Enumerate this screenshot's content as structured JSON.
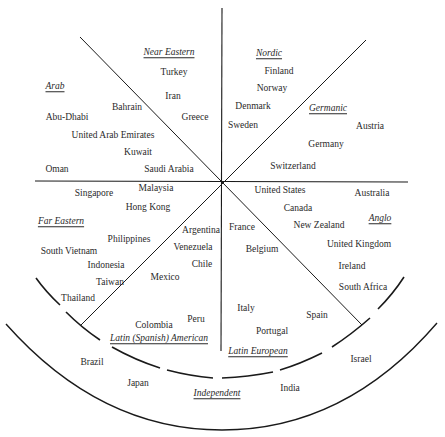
{
  "diagram": {
    "type": "country-cluster-circle",
    "center": {
      "x": 222,
      "y": 182
    },
    "clusters": [
      {
        "name": "Arab",
        "label_pos": [
          55,
          87
        ],
        "countries": [
          {
            "name": "Bahrain",
            "pos": [
              127,
              108
            ]
          },
          {
            "name": "Abu-Dhabi",
            "pos": [
              67,
              118
            ]
          },
          {
            "name": "United Arab Emirates",
            "pos": [
              113,
              136
            ]
          },
          {
            "name": "Kuwait",
            "pos": [
              138,
              153
            ]
          },
          {
            "name": "Oman",
            "pos": [
              57,
              170
            ]
          },
          {
            "name": "Saudi Arabia",
            "pos": [
              169,
              170
            ]
          }
        ]
      },
      {
        "name": "Near Eastern",
        "label_pos": [
          169,
          53
        ],
        "countries": [
          {
            "name": "Turkey",
            "pos": [
              174,
              73
            ]
          },
          {
            "name": "Iran",
            "pos": [
              173,
              97
            ]
          },
          {
            "name": "Greece",
            "pos": [
              195,
              118
            ]
          }
        ]
      },
      {
        "name": "Nordic",
        "label_pos": [
          269,
          54
        ],
        "countries": [
          {
            "name": "Finland",
            "pos": [
              279,
              72
            ]
          },
          {
            "name": "Norway",
            "pos": [
              272,
              89
            ]
          },
          {
            "name": "Denmark",
            "pos": [
              253,
              107
            ]
          },
          {
            "name": "Sweden",
            "pos": [
              243,
              126
            ]
          }
        ]
      },
      {
        "name": "Germanic",
        "label_pos": [
          328,
          109
        ],
        "countries": [
          {
            "name": "Austria",
            "pos": [
              370,
              127
            ]
          },
          {
            "name": "Germany",
            "pos": [
              326,
              145
            ]
          },
          {
            "name": "Switzerland",
            "pos": [
              293,
              167
            ]
          }
        ]
      },
      {
        "name": "Anglo",
        "label_pos": [
          380,
          219
        ],
        "countries": [
          {
            "name": "United States",
            "pos": [
              280,
              191
            ]
          },
          {
            "name": "Australia",
            "pos": [
              372,
              194
            ]
          },
          {
            "name": "Canada",
            "pos": [
              298,
              209
            ]
          },
          {
            "name": "New Zealand",
            "pos": [
              319,
              226
            ]
          },
          {
            "name": "United Kingdom",
            "pos": [
              359,
              245
            ]
          },
          {
            "name": "Ireland",
            "pos": [
              352,
              267
            ]
          },
          {
            "name": "South Africa",
            "pos": [
              363,
              288
            ]
          }
        ]
      },
      {
        "name": "Latin European",
        "label_pos": [
          258,
          352
        ],
        "countries": [
          {
            "name": "France",
            "pos": [
              242,
              228
            ]
          },
          {
            "name": "Belgium",
            "pos": [
              262,
              250
            ]
          },
          {
            "name": "Italy",
            "pos": [
              246,
              309
            ]
          },
          {
            "name": "Spain",
            "pos": [
              317,
              316
            ]
          },
          {
            "name": "Portugal",
            "pos": [
              272,
              332
            ]
          }
        ]
      },
      {
        "name": "Latin (Spanish) American",
        "label_pos": [
          159,
          339
        ],
        "countries": [
          {
            "name": "Argentina",
            "pos": [
              201,
              231
            ]
          },
          {
            "name": "Venezuela",
            "pos": [
              193,
              248
            ]
          },
          {
            "name": "Chile",
            "pos": [
              202,
              265
            ]
          },
          {
            "name": "Mexico",
            "pos": [
              165,
              278
            ]
          },
          {
            "name": "Peru",
            "pos": [
              196,
              320
            ]
          },
          {
            "name": "Colombia",
            "pos": [
              154,
              326
            ]
          }
        ]
      },
      {
        "name": "Far Eastern",
        "label_pos": [
          61,
          222
        ],
        "countries": [
          {
            "name": "Malaysia",
            "pos": [
              156,
              189
            ]
          },
          {
            "name": "Singapore",
            "pos": [
              94,
              194
            ]
          },
          {
            "name": "Hong Kong",
            "pos": [
              148,
              208
            ]
          },
          {
            "name": "Philippines",
            "pos": [
              129,
              240
            ]
          },
          {
            "name": "South Vietnam",
            "pos": [
              69,
              252
            ]
          },
          {
            "name": "Indonesia",
            "pos": [
              106,
              266
            ]
          },
          {
            "name": "Taiwan",
            "pos": [
              110,
              283
            ]
          },
          {
            "name": "Thailand",
            "pos": [
              78,
              299
            ]
          }
        ]
      },
      {
        "name": "Independent",
        "label_pos": [
          217,
          394
        ],
        "countries": [
          {
            "name": "Brazil",
            "pos": [
              92,
              363
            ]
          },
          {
            "name": "Japan",
            "pos": [
              138,
              384
            ]
          },
          {
            "name": "India",
            "pos": [
              290,
              389
            ]
          },
          {
            "name": "Israel",
            "pos": [
              361,
              360
            ]
          }
        ]
      }
    ]
  }
}
